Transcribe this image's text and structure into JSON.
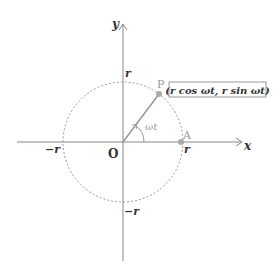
{
  "diagram": {
    "axes": {
      "x_label": "x",
      "y_label": "y",
      "origin_label": "O"
    },
    "tick_labels": {
      "x_pos": "r",
      "x_neg": "−r",
      "y_pos": "r",
      "y_neg": "−r"
    },
    "points": {
      "P": {
        "label": "P",
        "coords_label": "(r cos ωt,  r sin ωt)"
      },
      "A": {
        "label": "A"
      }
    },
    "angle_label": "ωt",
    "colors": {
      "axis": "#888888",
      "circle": "#999999",
      "point": "#aaaaaa",
      "text": "#333333",
      "gray_text": "#999999"
    }
  }
}
